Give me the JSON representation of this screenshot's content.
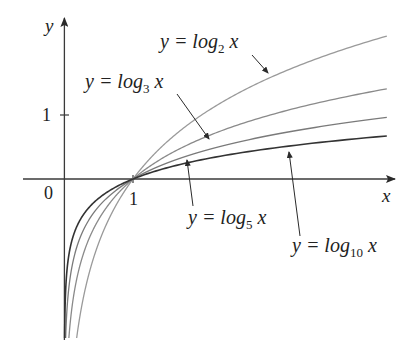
{
  "chart_data": {
    "type": "line",
    "title": "",
    "xlabel": "x",
    "ylabel": "y",
    "x_ticks": [
      {
        "value": 0,
        "label": "0"
      },
      {
        "value": 1,
        "label": "1"
      }
    ],
    "y_ticks": [
      {
        "value": 1,
        "label": "1"
      }
    ],
    "xlim": [
      -0.6,
      4.8
    ],
    "ylim": [
      -2.5,
      2.5
    ],
    "grid": false,
    "legend": "inline annotations with arrows",
    "domain": [
      0.005,
      4.7
    ],
    "common_point": {
      "x": 1,
      "y": 0
    },
    "series": [
      {
        "name": "y = log_2 x",
        "base": 2,
        "color": "#9a9a9a",
        "width": 1.3,
        "x": [
          0.25,
          0.5,
          1,
          2,
          3,
          4,
          4.7
        ],
        "values": [
          -2.0,
          -1.0,
          0,
          1.0,
          1.585,
          2.0,
          2.23
        ]
      },
      {
        "name": "y = log_3 x",
        "base": 3,
        "color": "#8a8a8a",
        "width": 1.3,
        "x": [
          0.25,
          0.5,
          1,
          2,
          3,
          4,
          4.7
        ],
        "values": [
          -1.262,
          -0.631,
          0,
          0.631,
          1.0,
          1.262,
          1.409
        ]
      },
      {
        "name": "y = log_5 x",
        "base": 5,
        "color": "#7a7a7a",
        "width": 1.3,
        "x": [
          0.25,
          0.5,
          1,
          2,
          3,
          4,
          4.7
        ],
        "values": [
          -0.861,
          -0.431,
          0,
          0.431,
          0.683,
          0.861,
          0.962
        ]
      },
      {
        "name": "y = log_10 x",
        "base": 10,
        "color": "#333333",
        "width": 1.6,
        "x": [
          0.25,
          0.5,
          1,
          2,
          3,
          4,
          4.7
        ],
        "values": [
          -0.602,
          -0.301,
          0,
          0.301,
          0.477,
          0.602,
          0.672
        ]
      }
    ],
    "annotations": [
      {
        "id": "log2",
        "prefix": "y = log",
        "sub": "2",
        "suffix": " x"
      },
      {
        "id": "log3",
        "prefix": "y = log",
        "sub": "3",
        "suffix": " x"
      },
      {
        "id": "log5",
        "prefix": "y = log",
        "sub": "5",
        "suffix": " x"
      },
      {
        "id": "log10",
        "prefix": "y = log",
        "sub": "10",
        "suffix": " x"
      }
    ]
  },
  "axes": {
    "x_label": "x",
    "y_label": "y",
    "origin_label": "0",
    "x_tick_label": "1",
    "y_tick_label": "1",
    "axis_color": "#3a3a3a"
  }
}
